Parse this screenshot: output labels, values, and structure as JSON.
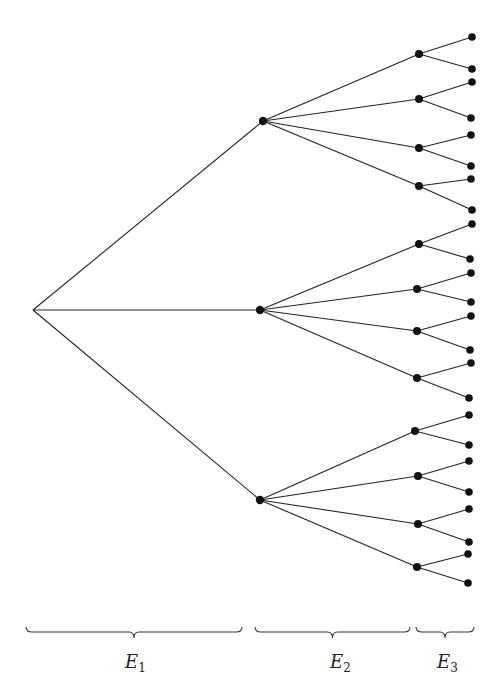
{
  "diagram": {
    "type": "tree",
    "root": {
      "x": 33,
      "y": 310
    },
    "level1": [
      {
        "x": 263,
        "y": 121
      },
      {
        "x": 260,
        "y": 310
      },
      {
        "x": 260,
        "y": 500
      }
    ],
    "level2": [
      {
        "x": 419,
        "y": 54,
        "parent": 0
      },
      {
        "x": 419,
        "y": 99,
        "parent": 0
      },
      {
        "x": 419,
        "y": 148,
        "parent": 0
      },
      {
        "x": 419,
        "y": 186,
        "parent": 0
      },
      {
        "x": 419,
        "y": 244,
        "parent": 1
      },
      {
        "x": 417,
        "y": 289,
        "parent": 1
      },
      {
        "x": 417,
        "y": 331,
        "parent": 1
      },
      {
        "x": 417,
        "y": 378,
        "parent": 1
      },
      {
        "x": 415,
        "y": 431,
        "parent": 2
      },
      {
        "x": 418,
        "y": 476,
        "parent": 2
      },
      {
        "x": 418,
        "y": 524,
        "parent": 2
      },
      {
        "x": 417,
        "y": 567,
        "parent": 2
      }
    ],
    "level3": [
      {
        "x": 472,
        "y": 37,
        "parent": 0
      },
      {
        "x": 472,
        "y": 69,
        "parent": 0
      },
      {
        "x": 472,
        "y": 82,
        "parent": 1
      },
      {
        "x": 471,
        "y": 118,
        "parent": 1
      },
      {
        "x": 471,
        "y": 135,
        "parent": 2
      },
      {
        "x": 471,
        "y": 166,
        "parent": 2
      },
      {
        "x": 471,
        "y": 179,
        "parent": 3
      },
      {
        "x": 472,
        "y": 210,
        "parent": 3
      },
      {
        "x": 472,
        "y": 224,
        "parent": 4
      },
      {
        "x": 470,
        "y": 259,
        "parent": 4
      },
      {
        "x": 471,
        "y": 273,
        "parent": 5
      },
      {
        "x": 471,
        "y": 302,
        "parent": 5
      },
      {
        "x": 471,
        "y": 316,
        "parent": 6
      },
      {
        "x": 470,
        "y": 350,
        "parent": 6
      },
      {
        "x": 471,
        "y": 363,
        "parent": 7
      },
      {
        "x": 469,
        "y": 398,
        "parent": 7
      },
      {
        "x": 469,
        "y": 415,
        "parent": 8
      },
      {
        "x": 469,
        "y": 445,
        "parent": 8
      },
      {
        "x": 469,
        "y": 461,
        "parent": 9
      },
      {
        "x": 469,
        "y": 492,
        "parent": 9
      },
      {
        "x": 469,
        "y": 509,
        "parent": 10
      },
      {
        "x": 469,
        "y": 542,
        "parent": 10
      },
      {
        "x": 468,
        "y": 554,
        "parent": 11
      },
      {
        "x": 468,
        "y": 583,
        "parent": 11
      }
    ],
    "braces": [
      {
        "x1": 26,
        "x2": 242,
        "y": 632,
        "label": "E",
        "subscript": "1",
        "label_x": 125,
        "label_y": 668
      },
      {
        "x1": 255,
        "x2": 410,
        "y": 632,
        "label": "E",
        "subscript": "2",
        "label_x": 330,
        "label_y": 668
      },
      {
        "x1": 416,
        "x2": 474,
        "y": 632,
        "label": "E",
        "subscript": "3",
        "label_x": 437,
        "label_y": 668
      }
    ]
  },
  "labels": {
    "e1": "E",
    "e1_sub": "1",
    "e2": "E",
    "e2_sub": "2",
    "e3": "E",
    "e3_sub": "3"
  },
  "colors": {
    "line": "#222222",
    "node": "#111111",
    "background": "#ffffff"
  }
}
